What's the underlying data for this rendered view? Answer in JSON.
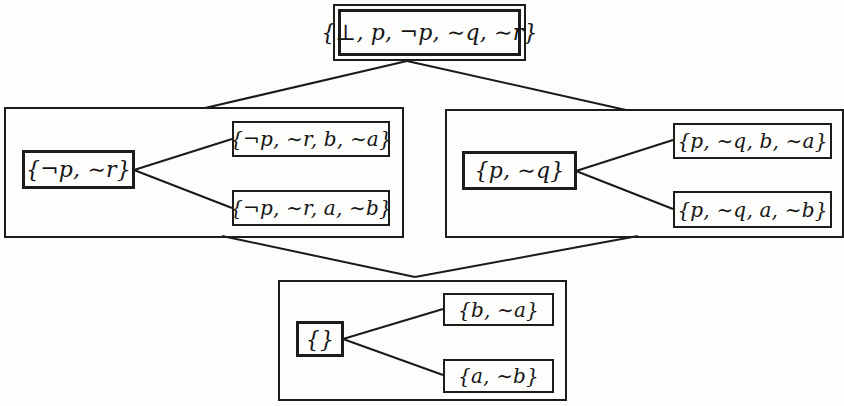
{
  "diagram": {
    "type": "lattice-of-trees",
    "colors": {
      "line": "#1a1a1a",
      "background": "#fdfdfb"
    },
    "top": {
      "label": "{⊥, p, ¬p, ∼q, ∼r}"
    },
    "groups": [
      {
        "id": "left",
        "root": "{¬p, ∼r}",
        "children": [
          "{¬p, ∼r, b, ∼a}",
          "{¬p, ∼r, a, ∼b}"
        ]
      },
      {
        "id": "right",
        "root": "{p, ∼q}",
        "children": [
          "{p, ∼q, b, ∼a}",
          "{p, ∼q, a, ∼b}"
        ]
      },
      {
        "id": "bottom",
        "root": "{}",
        "children": [
          "{b, ∼a}",
          "{a, ∼b}"
        ]
      }
    ],
    "edges": [
      [
        "top",
        "left"
      ],
      [
        "top",
        "right"
      ],
      [
        "left",
        "bottom"
      ],
      [
        "right",
        "bottom"
      ],
      [
        "left.root",
        "left.children.0"
      ],
      [
        "left.root",
        "left.children.1"
      ],
      [
        "right.root",
        "right.children.0"
      ],
      [
        "right.root",
        "right.children.1"
      ],
      [
        "bottom.root",
        "bottom.children.0"
      ],
      [
        "bottom.root",
        "bottom.children.1"
      ]
    ]
  }
}
